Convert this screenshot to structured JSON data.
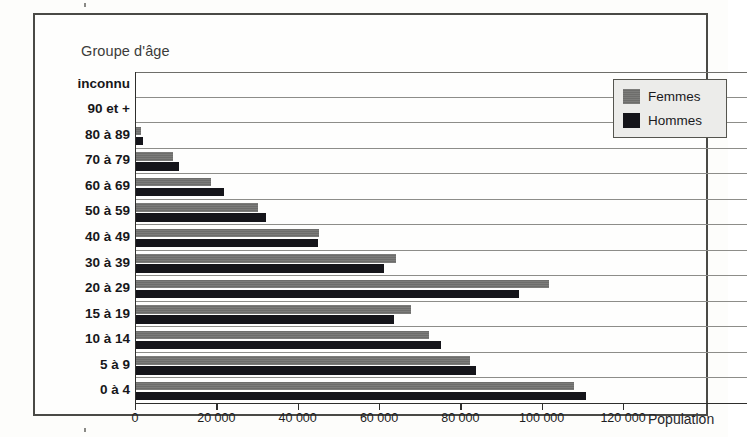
{
  "axis_caption": "Groupe d'âge",
  "legend": {
    "items": [
      {
        "label": "Femmes",
        "color": "#6d6d6b",
        "key": "femmes"
      },
      {
        "label": "Hommes",
        "color": "#15151a",
        "key": "hommes"
      }
    ]
  },
  "x_axis": {
    "title": "Population",
    "ticks": [
      "0",
      "20 000",
      "40 000",
      "60 000",
      "80 000",
      "100 000",
      "120 000"
    ]
  },
  "chart_data": {
    "type": "bar",
    "orientation": "horizontal",
    "title": "",
    "xlabel": "Population",
    "ylabel": "Groupe d'âge",
    "xlim": [
      0,
      120000
    ],
    "xticks": [
      0,
      20000,
      40000,
      60000,
      80000,
      100000,
      120000
    ],
    "grid": true,
    "legend_position": "top-right",
    "categories": [
      "inconnu",
      "90 et +",
      "80 à 89",
      "70 à 79",
      "60 à 69",
      "50 à 59",
      "40 à 49",
      "30 à 39",
      "20 à 29",
      "15 à 19",
      "10 à 14",
      "5 à 9",
      "0 à 4"
    ],
    "series": [
      {
        "name": "Femmes",
        "color": "#6d6d6b",
        "values": [
          0,
          0,
          1300,
          9100,
          18500,
          30000,
          45000,
          64000,
          101500,
          67600,
          72000,
          82100,
          107700
        ]
      },
      {
        "name": "Hommes",
        "color": "#15151a",
        "values": [
          0,
          0,
          1700,
          10600,
          21600,
          32000,
          44800,
          61000,
          94100,
          63400,
          75000,
          83600,
          110600
        ]
      }
    ]
  }
}
